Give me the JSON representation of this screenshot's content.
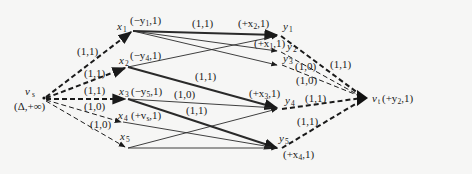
{
  "diagram": {
    "type": "flow-network",
    "colors": {
      "background": "#f6f6f5",
      "ink": "#1a1a1a"
    },
    "source": {
      "id": "vs",
      "name": "v",
      "sub": "s",
      "label": "(Δ,+∞)"
    },
    "sink": {
      "id": "vt",
      "name": "v",
      "sub": "t",
      "label": "(+y",
      "label_sub": "2",
      "label_tail": ",1)"
    },
    "x_nodes": [
      {
        "id": "x1",
        "name": "x",
        "sub": "1",
        "label_pre": "(−y",
        "label_sub": "1",
        "label_post": ",1)"
      },
      {
        "id": "x2",
        "name": "x",
        "sub": "2",
        "label_pre": "(−y",
        "label_sub": "4",
        "label_post": ",1)"
      },
      {
        "id": "x3",
        "name": "x",
        "sub": "3",
        "label_pre": "(−y",
        "label_sub": "5",
        "label_post": ",1)"
      },
      {
        "id": "x4",
        "name": "x",
        "sub": "4",
        "label_pre": "(+v",
        "label_sub": "s",
        "label_post": ",1)"
      },
      {
        "id": "x5",
        "name": "x",
        "sub": "5",
        "label_pre": "",
        "label_sub": "",
        "label_post": ""
      }
    ],
    "y_nodes": [
      {
        "id": "y1",
        "name": "y",
        "sub": "1",
        "label_pre": "(+x",
        "label_sub": "2",
        "label_post": ",1)"
      },
      {
        "id": "y2",
        "name": "y",
        "sub": "2",
        "label_pre": "(+x",
        "label_sub": "1",
        "label_post": ",1)"
      },
      {
        "id": "y3",
        "name": "y",
        "sub": "3",
        "label_pre": "",
        "label_sub": "",
        "label_post": ""
      },
      {
        "id": "y4",
        "name": "y",
        "sub": "4",
        "label_pre": "(+x",
        "label_sub": "3",
        "label_post": ",1)"
      },
      {
        "id": "y5",
        "name": "y",
        "sub": "5",
        "label_pre": "(+x",
        "label_sub": "4",
        "label_post": ",1)"
      }
    ],
    "source_edges": [
      {
        "to": "x1",
        "label": "(1,1)"
      },
      {
        "to": "x2",
        "label": "(1,1)"
      },
      {
        "to": "x3",
        "label": "(1,1)"
      },
      {
        "to": "x4",
        "label": "(1,0)"
      },
      {
        "to": "x5",
        "label": "(1,0)"
      }
    ],
    "middle_edge_labels": {
      "x1_y1": "(1,1)",
      "x2_y4": "(1,1)",
      "x3_y4": "(1,0)",
      "x3_y5": "(1,1)"
    },
    "sink_edges": [
      {
        "from": "y1",
        "label": "(1,1)"
      },
      {
        "from": "y2",
        "label": "(1,0)"
      },
      {
        "from": "y3",
        "label": "(1,0)"
      },
      {
        "from": "y4",
        "label": "(1,1)"
      },
      {
        "from": "y5",
        "label": "(1,1)"
      }
    ]
  }
}
